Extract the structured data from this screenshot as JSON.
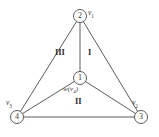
{
  "diagram": {
    "type": "planar-graph",
    "background_color": "#ffffff",
    "stroke_color": "#4a4a4a",
    "text_color": "#3a3a3a",
    "nodes": [
      {
        "id": "node-top",
        "number": "2",
        "label": "v",
        "sub": "1",
        "cx": 80,
        "cy": 16,
        "r": 6.5,
        "label_x": 88,
        "label_y": 9
      },
      {
        "id": "node-center",
        "number": "1",
        "label": "w",
        "sub": "4",
        "cx": 80,
        "cy": 78,
        "r": 6.5,
        "label_x": 64,
        "label_y": 86
      },
      {
        "id": "node-left",
        "number": "4",
        "label": "v",
        "sub": "3",
        "cx": 17,
        "cy": 117,
        "r": 6.5,
        "label_x": 9,
        "label_y": 100
      },
      {
        "id": "node-right",
        "number": "3",
        "label": "v",
        "sub": "2",
        "cx": 141,
        "cy": 117,
        "r": 6.5,
        "label_x": 133,
        "label_y": 100
      }
    ],
    "edges": [
      {
        "id": "edge-top-left",
        "from": "node-top",
        "to": "node-left"
      },
      {
        "id": "edge-top-right",
        "from": "node-top",
        "to": "node-right"
      },
      {
        "id": "edge-top-center",
        "from": "node-top",
        "to": "node-center"
      },
      {
        "id": "edge-center-left",
        "from": "node-center",
        "to": "node-left"
      },
      {
        "id": "edge-center-right",
        "from": "node-center",
        "to": "node-right"
      },
      {
        "id": "edge-left-right",
        "from": "node-left",
        "to": "node-right"
      }
    ],
    "regions": [
      {
        "id": "region-one",
        "label": "I",
        "x": 88,
        "y": 52
      },
      {
        "id": "region-two",
        "label": "II",
        "x": 75,
        "y": 101
      },
      {
        "id": "region-three",
        "label": "III",
        "x": 58,
        "y": 52
      }
    ],
    "center_label_text": "w(v4)"
  }
}
